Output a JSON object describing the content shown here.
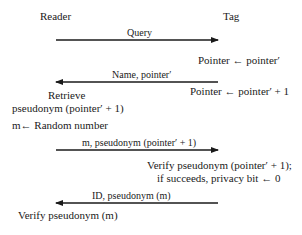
{
  "diagram": {
    "type": "sequence",
    "participants": {
      "reader": "Reader",
      "tag": "Tag"
    },
    "messages": [
      {
        "label": "Query",
        "direction": "reader-to-tag"
      },
      {
        "label": "Name, pointer′",
        "direction": "tag-to-reader"
      },
      {
        "label": "m, pseudonym (pointer′ + 1)",
        "direction": "reader-to-tag"
      },
      {
        "label": "ID, pseudonym (m)",
        "direction": "tag-to-reader"
      }
    ],
    "tag_actions": {
      "a1": "Pointer ← pointer′",
      "a2": "Pointer ← pointer′ + 1",
      "a3_line1": "Verify pseudonym (pointer′ + 1);",
      "a3_line2": "if succeeds, privacy bit  ← 0"
    },
    "reader_actions": {
      "r1_line1": "Retrieve",
      "r1_line2": "pseudonym (pointer′ + 1)",
      "r2": "m← Random number",
      "r3": "Verify pseudonym (m)"
    },
    "colors": {
      "line": "#1a1a1a",
      "text": "#1a1a1a",
      "background": "#ffffff"
    }
  }
}
